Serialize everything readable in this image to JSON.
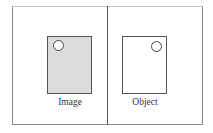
{
  "diagram": {
    "panels": [
      {
        "label": "Image",
        "fill": "#dcdcdc",
        "circle_position": "top-left"
      },
      {
        "label": "Object",
        "fill": "#ffffff",
        "circle_position": "top-right"
      }
    ]
  }
}
